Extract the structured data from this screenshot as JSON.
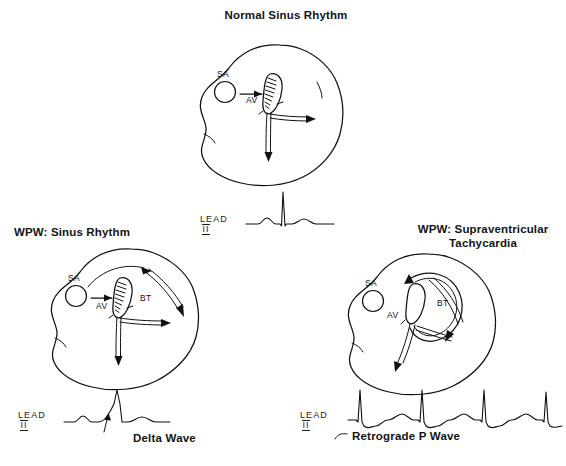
{
  "figure": {
    "type": "medical-diagram",
    "background_color": "#ffffff",
    "ink_color": "#111111"
  },
  "panels": [
    {
      "id": "normal-sinus-rhythm",
      "title": "Normal Sinus Rhythm",
      "heart": {
        "nodes": [
          {
            "label": "SA",
            "shape": "circle"
          },
          {
            "label": "AV",
            "shape": "hatched-oval"
          }
        ],
        "pathways": [
          "SA to AV arrow",
          "bundle branches with arrows"
        ],
        "bypass_tract": false
      },
      "ecg": {
        "lead_label": "LEAD",
        "lead_numeral": "II",
        "beats": 1,
        "waveform": "normal P wave, narrow tall QRS, T wave",
        "annotation": null
      }
    },
    {
      "id": "wpw-sinus-rhythm",
      "title": "WPW: Sinus Rhythm",
      "heart": {
        "nodes": [
          {
            "label": "SA",
            "shape": "circle"
          },
          {
            "label": "AV",
            "shape": "hatched-oval"
          },
          {
            "label": "BT",
            "shape": "bypass-tract"
          }
        ],
        "pathways": [
          "SA to AV arrow",
          "bypass tract curved arrow",
          "bundle branches with arrows"
        ],
        "bypass_tract": true
      },
      "ecg": {
        "lead_label": "LEAD",
        "lead_numeral": "II",
        "beats": 1,
        "waveform": "P wave, slurred delta wave upstroke, wide QRS, T wave",
        "annotation": "Delta Wave"
      }
    },
    {
      "id": "wpw-supraventricular-tachycardia",
      "title": "WPW: Supraventricular\nTachycardia",
      "heart": {
        "nodes": [
          {
            "label": "SA",
            "shape": "circle"
          },
          {
            "label": "AV",
            "shape": "plain-oval"
          },
          {
            "label": "BT",
            "shape": "bypass-tract"
          }
        ],
        "pathways": [
          "re-entry circuit loop between AV node and bypass tract",
          "bundle branches with arrows"
        ],
        "bypass_tract": true
      },
      "ecg": {
        "lead_label": "LEAD",
        "lead_numeral": "II",
        "beats": 4,
        "waveform": "rapid narrow QRS complexes each followed by inverted retrograde P wave",
        "annotation": "Retrograde P Wave"
      }
    }
  ]
}
